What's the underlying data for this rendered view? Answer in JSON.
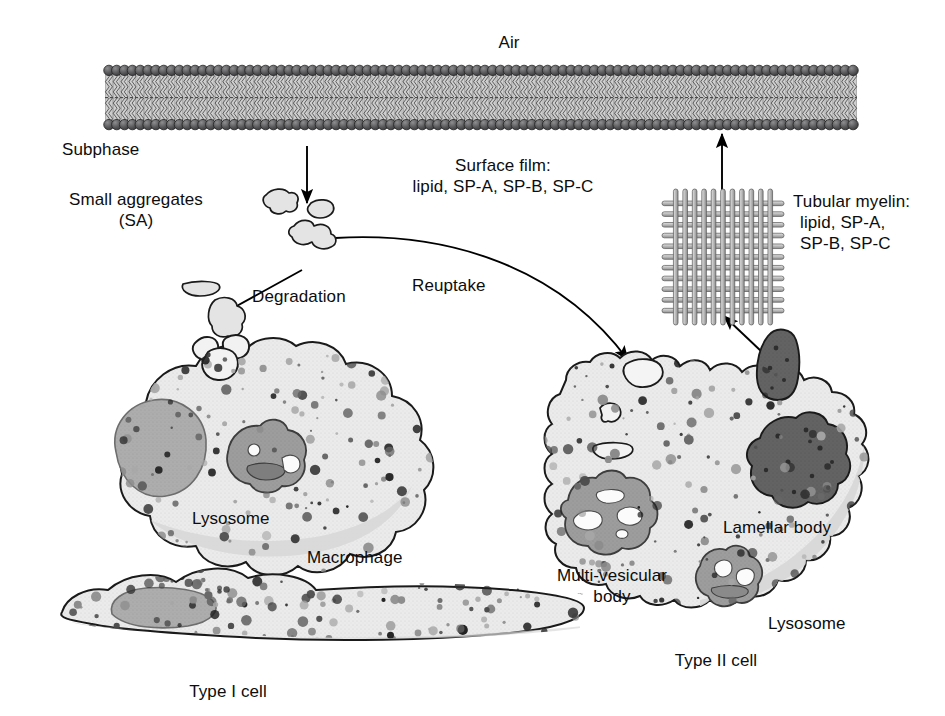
{
  "figure": {
    "domain_title": "Pulmonary surfactant metabolism",
    "background_color": "#ffffff",
    "ink_color": "#0d0d0d"
  },
  "labels": {
    "air": "Air",
    "subphase": "Subphase",
    "small_aggregates_line1": "Small aggregates",
    "small_aggregates_line2": "(SA)",
    "surface_film_line1": "Surface film:",
    "surface_film_line2": "lipid, SP-A, SP-B, SP-C",
    "tubular_myelin_line1": "Tubular myelin:",
    "tubular_myelin_line2": "lipid, SP-A,",
    "tubular_myelin_line3": "SP-B, SP-C",
    "degradation": "Degradation",
    "reuptake": "Reuptake",
    "lysosome_macrophage": "Lysosome",
    "macrophage": "Macrophage",
    "type_i_cell": "Type I cell",
    "type_ii_cell": "Type II cell",
    "multivesicular_body_line1": "Multi-vesicular",
    "multivesicular_body_line2": "body",
    "lamellar_body": "Lamellar body",
    "lysosome_typeii": "Lysosome"
  },
  "colors": {
    "membrane_head": "#58585a",
    "membrane_head_dark": "#3d3d3f",
    "membrane_tail_fill": "#d8d8d8",
    "cytoplasm": "#e9e9e9",
    "cytoplasm_edge": "#1a1a1a",
    "nucleus": "#a9a9a9",
    "organelle_mid": "#9a9a9a",
    "organelle_dark": "#6e6e6e",
    "lamellar_dark": "#5e5e5e",
    "vesicle_white": "#fbfbfb",
    "aggregate_fill": "#e2e2e2",
    "tubule_fill": "#c9c9c9",
    "arrow": "#000000"
  },
  "structures": {
    "membrane": {
      "name": "lipid-bilayer",
      "x_start": 105,
      "x_end": 857,
      "y_top": 66,
      "y_bottom": 129,
      "lipid_count": 96,
      "head_radius": 5.2
    },
    "tubular_myelin_lattice": {
      "name": "tubular-myelin-lattice",
      "x": 671,
      "y": 198,
      "width": 104,
      "height": 118,
      "horizontal_tubes": 11,
      "vertical_tubes": 11
    },
    "macrophage": {
      "name": "macrophage-cell",
      "cx": 210,
      "cy": 455
    },
    "type_i_cell": {
      "name": "type-i-cell",
      "cx": 300,
      "cy": 610
    },
    "type_ii_cell": {
      "name": "type-ii-cell",
      "cx": 730,
      "cy": 495
    }
  },
  "arrows": [
    {
      "name": "arrow-shedding-to-subphase",
      "from": [
        307,
        148
      ],
      "to": [
        307,
        205
      ],
      "kind": "straight"
    },
    {
      "name": "arrow-small-aggregates-to-degradation",
      "from": [
        300,
        272
      ],
      "to": [
        222,
        315
      ],
      "kind": "straight"
    },
    {
      "name": "arrow-degradation-into-macrophage",
      "from": [
        222,
        394
      ],
      "to": [
        258,
        437
      ],
      "kind": "straight"
    },
    {
      "name": "arrow-reuptake-curve",
      "from": [
        335,
        238
      ],
      "to": [
        631,
        365
      ],
      "kind": "curved"
    },
    {
      "name": "arrow-uptake-into-type-ii",
      "from": [
        620,
        385
      ],
      "to": [
        635,
        465
      ],
      "kind": "straight"
    },
    {
      "name": "arrow-mvb-to-lamellar-body",
      "from": [
        675,
        510
      ],
      "to": [
        745,
        490
      ],
      "kind": "straight"
    },
    {
      "name": "arrow-to-lysosome",
      "from": [
        672,
        505
      ],
      "to": [
        718,
        565
      ],
      "kind": "curved"
    },
    {
      "name": "arrow-lamellar-body-to-apex",
      "from": [
        790,
        480
      ],
      "to": [
        768,
        405
      ],
      "kind": "straight"
    },
    {
      "name": "arrow-secretion-to-tubular-myelin",
      "from": [
        760,
        350
      ],
      "to": [
        722,
        315
      ],
      "kind": "straight"
    },
    {
      "name": "arrow-tubular-myelin-to-film",
      "from": [
        722,
        192
      ],
      "to": [
        722,
        136
      ],
      "kind": "straight"
    }
  ]
}
